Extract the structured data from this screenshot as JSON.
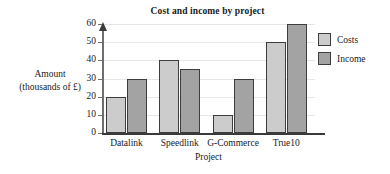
{
  "chart_data": {
    "type": "bar",
    "title": "Cost and income by project",
    "xlabel": "Project",
    "ylabel_line1": "Amount",
    "ylabel_line2": "(thousands of £)",
    "categories": [
      "Datalink",
      "Speedlink",
      "G-Commerce",
      "True10"
    ],
    "series": [
      {
        "name": "Costs",
        "values": [
          20,
          40,
          10,
          50
        ],
        "color": "#cccccc"
      },
      {
        "name": "Income",
        "values": [
          30,
          35,
          30,
          60
        ],
        "color": "#a3a3a3"
      }
    ],
    "ylim": [
      0,
      60
    ],
    "yticks": [
      0,
      10,
      20,
      30,
      40,
      50,
      60
    ],
    "ytick_labels": [
      "0",
      "10",
      "20",
      "30",
      "40",
      "50",
      "60"
    ],
    "grid": true,
    "legend_position": "right",
    "bar_border_color": "#3d3d3d",
    "axis_color": "#3a3a3a",
    "gridline_color": "#e6e6e6"
  }
}
